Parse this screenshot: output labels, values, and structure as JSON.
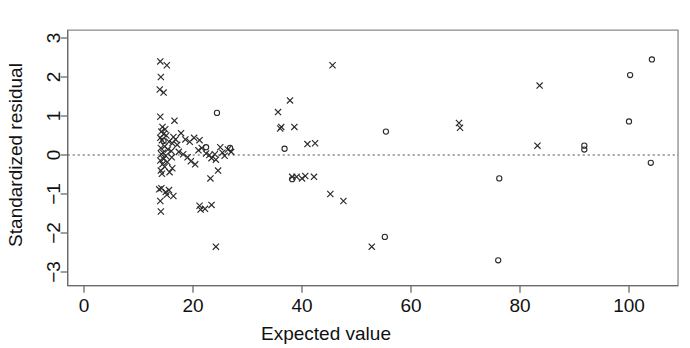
{
  "chart_data": {
    "type": "scatter",
    "title": "",
    "xlabel": "Expected value",
    "ylabel": "Standardized residual",
    "xlim": [
      -3,
      109
    ],
    "ylim": [
      -3.35,
      3.2
    ],
    "xticks": [
      0,
      20,
      40,
      60,
      80,
      100
    ],
    "yticks": [
      -3,
      -2,
      -1,
      0,
      1,
      2,
      3
    ],
    "xtick_labels": [
      "0",
      "20",
      "40",
      "60",
      "80",
      "100"
    ],
    "ytick_labels": [
      "-3",
      "-2",
      "-1",
      "0",
      "1",
      "2",
      "3"
    ],
    "grid": false,
    "legend": "none",
    "reference_line": {
      "orientation": "horizontal",
      "y": 0,
      "style": "dashed",
      "color": "#555555"
    },
    "frame": "box",
    "marker_colors": {
      "cross": "#2a2a2a",
      "circle": "#2a2a2a"
    },
    "series": [
      {
        "name": "cross",
        "marker": "x",
        "points": [
          [
            14.0,
            2.4
          ],
          [
            15.2,
            2.3
          ],
          [
            14.1,
            2.0
          ],
          [
            13.9,
            1.68
          ],
          [
            14.6,
            1.6
          ],
          [
            14.0,
            0.98
          ],
          [
            16.6,
            0.88
          ],
          [
            14.4,
            0.72
          ],
          [
            14.9,
            0.66
          ],
          [
            14.2,
            0.6
          ],
          [
            14.6,
            0.54
          ],
          [
            15.1,
            0.5
          ],
          [
            16.4,
            0.46
          ],
          [
            16.8,
            0.4
          ],
          [
            14.0,
            0.44
          ],
          [
            14.3,
            0.38
          ],
          [
            15.6,
            0.34
          ],
          [
            16.2,
            0.3
          ],
          [
            17.1,
            0.26
          ],
          [
            14.8,
            0.22
          ],
          [
            14.1,
            0.18
          ],
          [
            15.4,
            0.14
          ],
          [
            16.0,
            0.1
          ],
          [
            17.4,
            0.08
          ],
          [
            14.5,
            0.06
          ],
          [
            14.2,
            0.02
          ],
          [
            15.0,
            -0.02
          ],
          [
            16.1,
            -0.06
          ],
          [
            14.6,
            -0.1
          ],
          [
            14.0,
            -0.14
          ],
          [
            15.3,
            -0.18
          ],
          [
            14.4,
            -0.24
          ],
          [
            14.8,
            -0.3
          ],
          [
            16.2,
            -0.34
          ],
          [
            14.1,
            -0.4
          ],
          [
            15.7,
            -0.44
          ],
          [
            14.3,
            -0.48
          ],
          [
            18.2,
            0.02
          ],
          [
            19.0,
            -0.06
          ],
          [
            19.6,
            -0.16
          ],
          [
            20.4,
            -0.24
          ],
          [
            21.0,
            0.12
          ],
          [
            21.6,
            0.18
          ],
          [
            22.4,
            0.04
          ],
          [
            23.0,
            0.0
          ],
          [
            23.4,
            -0.08
          ],
          [
            24.0,
            0.02
          ],
          [
            24.2,
            -0.12
          ],
          [
            25.0,
            0.2
          ],
          [
            25.4,
            0.06
          ],
          [
            25.8,
            -0.02
          ],
          [
            26.4,
            0.14
          ],
          [
            27.0,
            0.08
          ],
          [
            24.6,
            -0.4
          ],
          [
            23.2,
            -0.6
          ],
          [
            20.2,
            0.44
          ],
          [
            21.2,
            0.38
          ],
          [
            19.4,
            0.34
          ],
          [
            18.6,
            0.4
          ],
          [
            17.8,
            0.56
          ],
          [
            14.2,
            -0.85
          ],
          [
            15.6,
            -0.9
          ],
          [
            15.0,
            -0.95
          ],
          [
            15.2,
            -1.02
          ],
          [
            16.4,
            -1.05
          ],
          [
            13.8,
            -0.88
          ],
          [
            14.0,
            -1.18
          ],
          [
            14.1,
            -1.45
          ],
          [
            21.2,
            -1.3
          ],
          [
            21.4,
            -1.4
          ],
          [
            22.2,
            -1.38
          ],
          [
            23.4,
            -1.28
          ],
          [
            24.2,
            -2.35
          ],
          [
            35.6,
            1.1
          ],
          [
            37.8,
            1.4
          ],
          [
            36.2,
            0.72
          ],
          [
            36.0,
            0.68
          ],
          [
            38.6,
            0.72
          ],
          [
            41.0,
            0.28
          ],
          [
            42.4,
            0.3
          ],
          [
            45.6,
            2.3
          ],
          [
            39.0,
            -0.56
          ],
          [
            40.6,
            -0.54
          ],
          [
            42.2,
            -0.56
          ],
          [
            40.0,
            -0.6
          ],
          [
            38.2,
            -0.56
          ],
          [
            45.2,
            -1.0
          ],
          [
            47.6,
            -1.18
          ],
          [
            52.8,
            -2.35
          ],
          [
            68.8,
            0.82
          ],
          [
            69.0,
            0.7
          ],
          [
            83.2,
            0.24
          ],
          [
            83.6,
            1.78
          ]
        ]
      },
      {
        "name": "circle",
        "marker": "o",
        "points": [
          [
            14.6,
            0.36
          ],
          [
            24.4,
            1.08
          ],
          [
            22.4,
            0.2
          ],
          [
            26.8,
            0.18
          ],
          [
            36.8,
            0.16
          ],
          [
            38.2,
            -0.62
          ],
          [
            55.4,
            0.6
          ],
          [
            55.2,
            -2.1
          ],
          [
            76.2,
            -0.6
          ],
          [
            76.0,
            -2.7
          ],
          [
            91.8,
            0.24
          ],
          [
            91.8,
            0.14
          ],
          [
            100.2,
            2.05
          ],
          [
            104.2,
            2.45
          ],
          [
            100.0,
            0.86
          ],
          [
            104.0,
            -0.2
          ]
        ]
      }
    ]
  }
}
